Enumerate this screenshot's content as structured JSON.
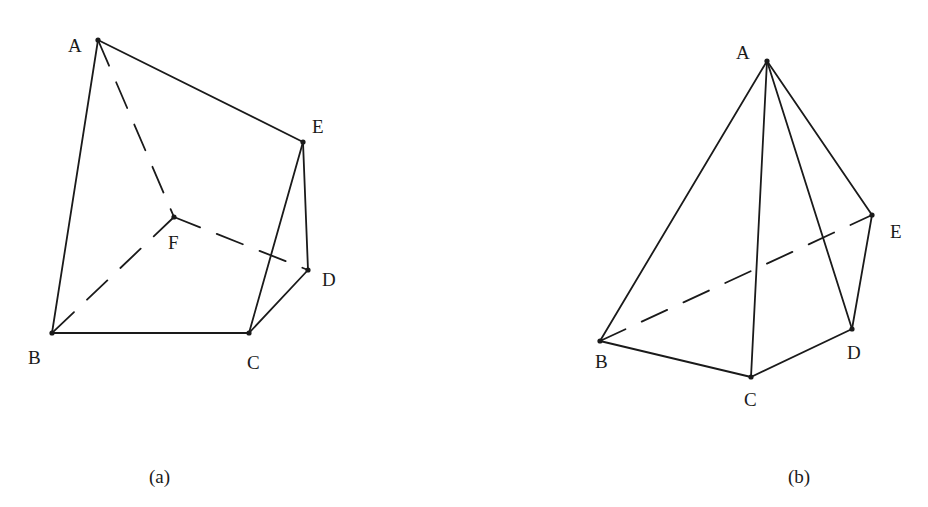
{
  "figures": [
    {
      "id": "a",
      "caption": "(a)",
      "caption_pos": [
        149,
        467
      ],
      "vertices": {
        "A": {
          "x": 98,
          "y": 40,
          "label": "A",
          "lx": 68,
          "ly": 36
        },
        "B": {
          "x": 52,
          "y": 333,
          "label": "B",
          "lx": 28,
          "ly": 348
        },
        "C": {
          "x": 249,
          "y": 333,
          "label": "C",
          "lx": 247,
          "ly": 353
        },
        "D": {
          "x": 308,
          "y": 270,
          "label": "D",
          "lx": 322,
          "ly": 270
        },
        "E": {
          "x": 303,
          "y": 142,
          "label": "E",
          "lx": 312,
          "ly": 117
        },
        "F": {
          "x": 174,
          "y": 217,
          "label": "F",
          "lx": 168,
          "ly": 233
        }
      },
      "solid_edges": [
        [
          "A",
          "B"
        ],
        [
          "A",
          "E"
        ],
        [
          "B",
          "C"
        ],
        [
          "C",
          "E"
        ],
        [
          "C",
          "D"
        ],
        [
          "D",
          "E"
        ]
      ],
      "hidden_edges": [
        [
          "A",
          "F"
        ],
        [
          "F",
          "B"
        ],
        [
          "F",
          "D"
        ]
      ]
    },
    {
      "id": "b",
      "caption": "(b)",
      "caption_pos": [
        788,
        467
      ],
      "vertices": {
        "A": {
          "x": 767,
          "y": 61,
          "label": "A",
          "lx": 736,
          "ly": 43
        },
        "B": {
          "x": 600,
          "y": 341,
          "label": "B",
          "lx": 595,
          "ly": 352
        },
        "C": {
          "x": 751,
          "y": 377,
          "label": "C",
          "lx": 744,
          "ly": 390
        },
        "D": {
          "x": 852,
          "y": 329,
          "label": "D",
          "lx": 847,
          "ly": 343
        },
        "E": {
          "x": 872,
          "y": 215,
          "label": "E",
          "lx": 890,
          "ly": 222
        }
      },
      "solid_edges": [
        [
          "A",
          "B"
        ],
        [
          "A",
          "C"
        ],
        [
          "A",
          "D"
        ],
        [
          "A",
          "E"
        ],
        [
          "B",
          "C"
        ],
        [
          "C",
          "D"
        ],
        [
          "D",
          "E"
        ]
      ],
      "hidden_edges": [
        [
          "B",
          "E"
        ]
      ]
    }
  ],
  "style": {
    "stroke": "#1a1a1a",
    "stroke_width": 1.8,
    "dash": "28 18",
    "point_radius": 2.6
  }
}
